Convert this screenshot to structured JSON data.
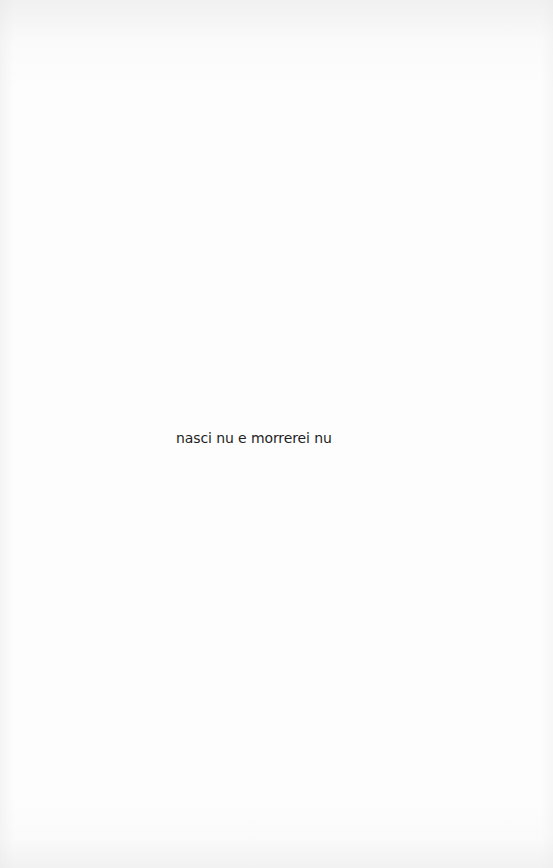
{
  "page": {
    "background_color": "#fdfdfd",
    "text_color": "#1e1e1e",
    "epigraph": "nasci nu e morrerei nu"
  }
}
